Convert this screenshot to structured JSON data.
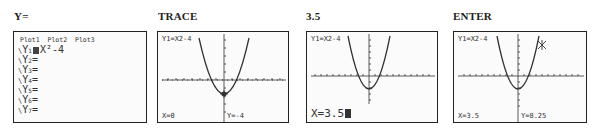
{
  "steps": [
    {
      "label": "Y="
    },
    {
      "label": "TRACE"
    },
    {
      "label": "3.5"
    },
    {
      "label": "ENTER"
    }
  ],
  "y_editor": {
    "plots": [
      "Plot1",
      "Plot2",
      "Plot3"
    ],
    "rows": [
      {
        "name": "Y1",
        "sub": "1",
        "expr": "X²-4",
        "selected": true
      },
      {
        "name": "Y2",
        "sub": "2",
        "expr": ""
      },
      {
        "name": "Y3",
        "sub": "3",
        "expr": ""
      },
      {
        "name": "Y4",
        "sub": "4",
        "expr": ""
      },
      {
        "name": "Y5",
        "sub": "5",
        "expr": ""
      },
      {
        "name": "Y6",
        "sub": "6",
        "expr": ""
      },
      {
        "name": "Y7",
        "sub": "7",
        "expr": ""
      }
    ]
  },
  "graphs": {
    "trace": {
      "func_label": "Y1=X2-4",
      "x_readout": "X=0",
      "y_readout": "Y=-4"
    },
    "input": {
      "func_label": "Y1=X2-4",
      "entry": "X=3.5"
    },
    "enter": {
      "func_label": "Y1=X2-4",
      "x_readout": "X=3.5",
      "y_readout": "Y=8.25"
    }
  },
  "colors": {
    "ink": "#333333",
    "border": "#222222",
    "screen_bg": "#fbfbfb"
  }
}
